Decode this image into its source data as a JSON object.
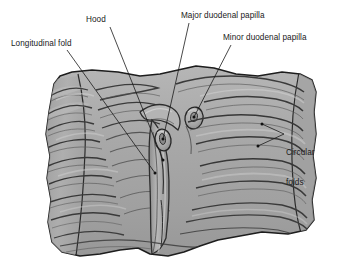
{
  "figure": {
    "background_color": "#ffffff",
    "tissue_fill": "#a8a8a8",
    "tissue_fill_light": "#c4c4c4",
    "tissue_fill_dark": "#8e8e8e",
    "outline_color": "#1d1d1d",
    "fold_line_color": "#4a4a4a",
    "leader_color": "#1a1a1a",
    "label_color": "#1a1a1a"
  },
  "labels": {
    "longitudinal_fold": "Longitudinal fold",
    "hood": "Hood",
    "major_duodenal_papilla": "Major duodenal papilla",
    "minor_duodenal_papilla": "Minor duodenal papilla",
    "circular_folds_line1": "Circular",
    "circular_folds_line2": "folds"
  },
  "structures": [
    "circular-folds",
    "longitudinal-fold",
    "hood",
    "major-duodenal-papilla",
    "minor-duodenal-papilla",
    "duodenal-wall"
  ]
}
